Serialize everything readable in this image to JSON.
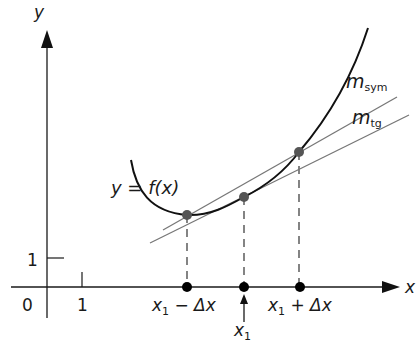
{
  "figure": {
    "type": "secant-vs-tangent slope diagram",
    "axes": {
      "x_label": "x",
      "y_label": "y",
      "origin_label": "0",
      "x_tick_label": "1",
      "y_tick_label": "1"
    },
    "curve_label": "y = f(x)",
    "lines": {
      "secant": {
        "label_main": "m",
        "label_sub": "sym"
      },
      "tangent": {
        "label_main": "m",
        "label_sub": "tg"
      }
    },
    "points": {
      "left": {
        "label_main": "x",
        "label_sub": "1",
        "label_rest": " − Δx"
      },
      "center": {
        "label_main": "x",
        "label_sub": "1"
      },
      "right": {
        "label_main": "x",
        "label_sub": "1",
        "label_rest": " + Δx"
      }
    },
    "colors": {
      "axis": "#1a1a1a",
      "curve": "#111111",
      "lines": "#777777",
      "points": "#555555",
      "axis_points": "#000000"
    }
  }
}
